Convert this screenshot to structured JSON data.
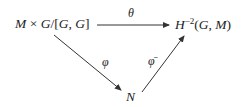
{
  "diagram": {
    "type": "commutative-diagram",
    "nodes": {
      "source": {
        "text": "M × G/[G, G]",
        "parts": [
          "M",
          " × ",
          "G",
          "/[",
          "G",
          ", ",
          "G",
          "]"
        ]
      },
      "target": {
        "text": "H^{-2}(G, M)",
        "base": "H",
        "superscript": "−2",
        "args_open": "(",
        "arg1": "G",
        "sep": ", ",
        "arg2": "M",
        "args_close": ")"
      },
      "bottom": {
        "text": "N"
      }
    },
    "arrows": [
      {
        "id": "theta",
        "from": "source",
        "to": "target",
        "label": "θ"
      },
      {
        "id": "phi",
        "from": "source",
        "to": "bottom",
        "label": "φ"
      },
      {
        "id": "phi_bar",
        "from": "bottom",
        "to": "target",
        "label": "φ̄"
      }
    ],
    "colors": {
      "ink": "#222222",
      "background": "#ffffff"
    }
  }
}
